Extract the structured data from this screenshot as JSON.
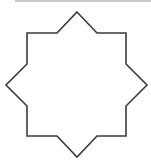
{
  "diagram": {
    "shape": "eight-pointed-star",
    "stroke_color": "#3a3a3a",
    "fill_color": "#ffffff",
    "rule_color": "#c8c8c8"
  }
}
